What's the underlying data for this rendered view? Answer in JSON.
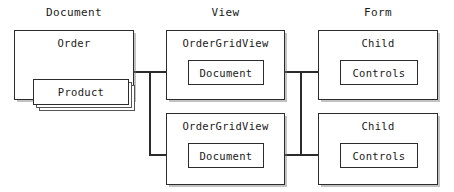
{
  "diagram": {
    "type": "block-diagram",
    "columns": [
      {
        "id": "document",
        "heading": "Document"
      },
      {
        "id": "view",
        "heading": "View"
      },
      {
        "id": "form",
        "heading": "Form"
      }
    ],
    "nodes": {
      "order": {
        "label": "Order"
      },
      "product": {
        "label": "Product",
        "stacked": true,
        "stack_count": 3
      },
      "ogv_top": {
        "label": "OrderGridView"
      },
      "ogv_bottom": {
        "label": "OrderGridView"
      },
      "doc_top": {
        "label": "Document"
      },
      "doc_bottom": {
        "label": "Document"
      },
      "child_top": {
        "label": "Child"
      },
      "child_bottom": {
        "label": "Child"
      },
      "ctrl_top": {
        "label": "Controls"
      },
      "ctrl_bottom": {
        "label": "Controls"
      }
    },
    "colors": {
      "stroke": "#2b2b2b",
      "stroke_light": "#555555",
      "text": "#1a1a1a",
      "background": "#ffffff",
      "shadow": "rgba(120,120,120,0.45)"
    }
  }
}
